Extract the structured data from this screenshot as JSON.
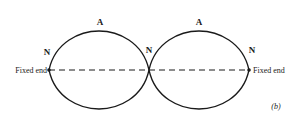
{
  "diagram": {
    "type": "standing-wave",
    "labels": {
      "antinode": "A",
      "node": "N",
      "fixed_end": "Fixed end",
      "panel": "(b)"
    },
    "colors": {
      "stroke": "#1a1a1a",
      "background": "#ffffff"
    }
  }
}
